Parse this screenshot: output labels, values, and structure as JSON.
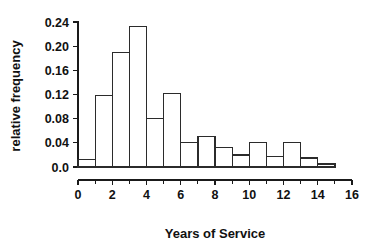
{
  "chart_data": {
    "type": "bar",
    "title": "",
    "xlabel": "Years of Service",
    "ylabel": "relative frequency",
    "xlim": [
      0,
      16
    ],
    "ylim": [
      0,
      0.25
    ],
    "grid": false,
    "legend": null,
    "bin_width": 1,
    "bin_edges": [
      0,
      1,
      2,
      3,
      4,
      5,
      6,
      7,
      8,
      9,
      10,
      11,
      12,
      13,
      14,
      15
    ],
    "categories": [
      "0-1",
      "1-2",
      "2-3",
      "3-4",
      "4-5",
      "5-6",
      "6-7",
      "7-8",
      "8-9",
      "9-10",
      "10-11",
      "11-12",
      "12-13",
      "13-14",
      "14-15"
    ],
    "values": [
      0.012,
      0.118,
      0.19,
      0.232,
      0.08,
      0.122,
      0.04,
      0.05,
      0.032,
      0.02,
      0.04,
      0.018,
      0.04,
      0.015,
      0.005
    ],
    "xticks": [
      0,
      2,
      4,
      6,
      8,
      10,
      12,
      14,
      16
    ],
    "xticklabels": [
      "0",
      "2",
      "4",
      "6",
      "8",
      "10",
      "12",
      "14",
      "16"
    ],
    "xminorticks": [
      1,
      3,
      5,
      7,
      9,
      11,
      13,
      15
    ],
    "yticks": [
      0.0,
      0.04,
      0.08,
      0.12,
      0.16,
      0.2,
      0.24
    ],
    "yticklabels": [
      "0.0",
      "0.04",
      "0.08",
      "0.12",
      "0.16",
      "0.20",
      "0.24"
    ],
    "colors": {
      "bar_fill": "#ffffff",
      "bar_stroke": "#2b2b2b",
      "axis": "#1a1a1a",
      "text": "#111111",
      "background": "#ffffff"
    }
  }
}
